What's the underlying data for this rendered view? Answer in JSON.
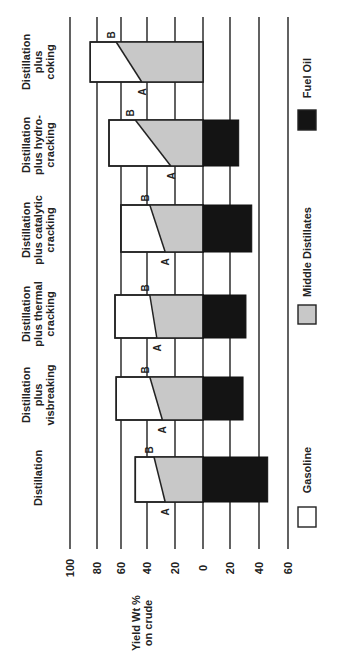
{
  "chart_data": {
    "type": "bar",
    "orientation": "stacked, rotated 90deg counter-clockwise (value axis runs horizontally)",
    "title": "",
    "ylabel": "Yield Wt % on crude",
    "xlabel": "",
    "axis_ticks": [
      "100",
      "80",
      "60",
      "40",
      "20",
      "0",
      "20",
      "40",
      "60"
    ],
    "axis_tick_values": [
      100,
      80,
      60,
      40,
      20,
      0,
      -20,
      -40,
      -60
    ],
    "ylim": [
      -60,
      100
    ],
    "grid": true,
    "legend_position": "bottom (right side of rotated page)",
    "legend": [
      {
        "name": "Gasoline",
        "color": "#ffffff"
      },
      {
        "name": "Middle Distillates",
        "color": "#c8c8c8"
      },
      {
        "name": "Fuel Oil",
        "color": "#141414"
      }
    ],
    "categories": [
      "Distillation",
      "Distillation plus visbreaking",
      "Distillation plus thermal cracking",
      "Distillation plus catalytic cracking",
      "Distillation plus hydro-cracking",
      "Distillation plus coking"
    ],
    "category_label_lines": [
      [
        "Distillation"
      ],
      [
        "Distillation",
        "plus",
        "visbreaking"
      ],
      [
        "Distillation",
        "plus thermal",
        "cracking"
      ],
      [
        "Distillation",
        "plus catalytic",
        "cracking"
      ],
      [
        "Distillation",
        "plus hydro-",
        "cracking"
      ],
      [
        "Distillation",
        "plus",
        "coking"
      ]
    ],
    "series": [
      {
        "name": "Total light products (Gasoline + Middle Distillates, above 0)",
        "values": [
          49,
          64,
          65,
          60,
          70,
          85
        ]
      },
      {
        "name": "Gasoline/Middle Distillate split at B edge",
        "values": [
          35,
          38,
          38,
          38,
          49,
          64
        ]
      },
      {
        "name": "Gasoline/Middle Distillate split at A edge",
        "values": [
          27,
          29,
          33,
          27,
          23,
          44
        ]
      },
      {
        "name": "Fuel Oil (below 0)",
        "values": [
          46,
          29,
          31,
          35,
          26,
          0
        ]
      }
    ],
    "annotations": [
      "A",
      "B"
    ]
  },
  "labels": {
    "ylabel_line1": "Yield Wt %",
    "ylabel_line2": "on crude",
    "marker_a": "A",
    "marker_b": "B"
  }
}
